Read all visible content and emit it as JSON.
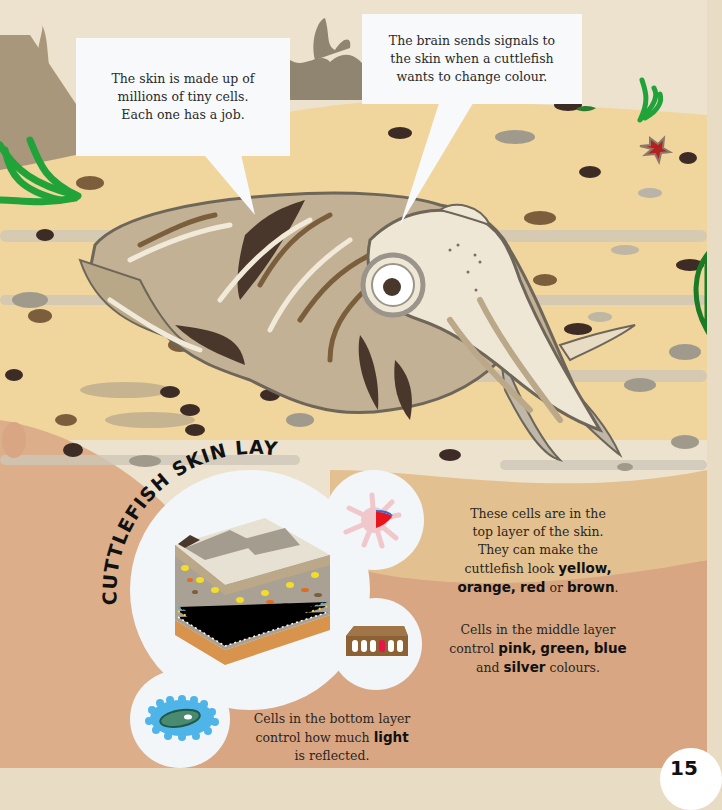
{
  "page": {
    "number": "15",
    "title": "CUTTLEFISH SKIN LAYERS"
  },
  "speech_bubbles": [
    {
      "id": "skin-cells",
      "text_lines": [
        "The skin is made up of",
        "millions of tiny cells.",
        "Each one has a job."
      ]
    },
    {
      "id": "brain-signals",
      "text_lines": [
        "The brain sends signals to",
        "the skin when a cuttlefish",
        "wants to change colour."
      ]
    }
  ],
  "captions": {
    "top_layer": {
      "line1": "These cells are in the",
      "line2": "top layer of the skin.",
      "line3": "They can make the",
      "line4_pre": "cuttlefish look ",
      "yellow": "yellow,",
      "orange": "orange,",
      "red": "red",
      "or": " or ",
      "brown": "brown",
      "end": "."
    },
    "middle_layer": {
      "line1": "Cells in the middle layer",
      "line2_pre": "control ",
      "pink": "pink,",
      "green": "green,",
      "blue": "blue",
      "line3_pre": "and ",
      "silver": "silver",
      "line3_post": " colours."
    },
    "bottom_layer": {
      "line1": "Cells in the bottom layer",
      "line2_pre": "control how much ",
      "light": "light",
      "line3": "is reflected."
    }
  },
  "colors": {
    "sand": "#f0d59c",
    "sand_shadow": "#c9b48e",
    "lower_bg": "#d8a683",
    "sky": "#ede2cd",
    "rock": "#a8977b",
    "seaweed_green": "#22a33a",
    "cuttlefish_light": "#efe7d6",
    "cuttlefish_mid": "#bba889",
    "cuttlefish_dark": "#4a372c",
    "starfish_red": "#b52020",
    "chromatophore_red": "#e8141e",
    "iridophore_brown": "#8c6235",
    "leucophore_blue": "#4fb4e8"
  },
  "icons": [
    "seaweed-icon",
    "starfish-icon",
    "cuttlefish-illustration",
    "skin-block-icon",
    "chromatophore-cell-icon",
    "iridophore-cell-icon",
    "leucophore-cell-icon"
  ]
}
